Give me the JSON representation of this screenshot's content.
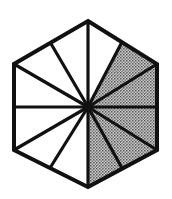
{
  "figure": {
    "title": "Regular hexagon divided into twelve sectors",
    "shape_name": "hexagon",
    "sector_count": 12,
    "shaded_count": 5,
    "unshaded_count": 7,
    "fraction_shaded": "5/12",
    "colors": {
      "outline": "#111111",
      "shaded_fill": "#9a9a9a",
      "unshaded_fill": "#ffffff",
      "background": "#ffffff",
      "halftone_dot": "#4a4a4a"
    },
    "geometry": {
      "center": [
        88,
        107
      ],
      "circumradius": 86,
      "stroke_width_outline": 4,
      "stroke_width_spoke": 3.2,
      "hex_vertices": [
        [
          88,
          21
        ],
        [
          157,
          64
        ],
        [
          157,
          150
        ],
        [
          88,
          187
        ],
        [
          14,
          150
        ],
        [
          14,
          64
        ]
      ],
      "spoke_endpoints": [
        [
          88,
          21
        ],
        [
          122,
          42
        ],
        [
          157,
          64
        ],
        [
          157,
          107
        ],
        [
          157,
          150
        ],
        [
          122,
          168
        ],
        [
          88,
          187
        ],
        [
          50,
          168
        ],
        [
          14,
          150
        ],
        [
          14,
          107
        ],
        [
          14,
          64
        ],
        [
          50,
          42
        ]
      ],
      "shaded_sector_indices": [
        1,
        2,
        3,
        4,
        5
      ]
    },
    "labels": {
      "caption": "",
      "shaded_label": "",
      "unshaded_label": ""
    }
  }
}
